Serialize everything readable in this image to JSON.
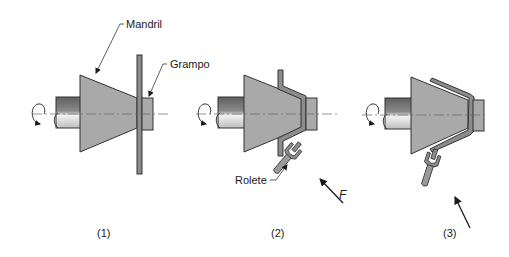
{
  "diagram": {
    "colors": {
      "part_fill": "#a9a9a9",
      "outline": "#333333",
      "shaft_dark": "#6e6e6e",
      "shaft_light": "#e6e6e6",
      "blank_fill": "#8c8c8c",
      "centerline": "#666666"
    },
    "labels": {
      "mandrel": "Mandril",
      "clamp": "Grampo",
      "roller": "Rolete",
      "force": "F"
    },
    "stages": [
      {
        "caption": "(1)",
        "description": "Flat blank clamped against mandrel"
      },
      {
        "caption": "(2)",
        "description": "Roller forces blank onto mandrel"
      },
      {
        "caption": "(3)",
        "description": "Blank fully formed onto mandrel"
      }
    ]
  }
}
